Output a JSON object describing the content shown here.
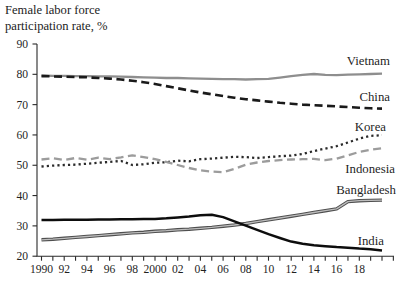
{
  "header": {
    "title_line1": "Female labor force",
    "title_line2": "participation rate, %"
  },
  "chart_data": {
    "type": "line",
    "title": "Female labor force participation rate, %",
    "xlabel": "",
    "ylabel": "Female labor force participation rate, %",
    "ylim": [
      20,
      90
    ],
    "yticks": [
      20,
      30,
      40,
      50,
      60,
      70,
      80,
      90
    ],
    "grid": false,
    "legend_position": "labels-at-line-ends",
    "axis_color": "#2a2a2a",
    "text_color": "#1f1f1f",
    "x_years": [
      1990,
      1991,
      1992,
      1993,
      1994,
      1995,
      1996,
      1997,
      1998,
      1999,
      2000,
      2001,
      2002,
      2003,
      2004,
      2005,
      2006,
      2007,
      2008,
      2009,
      2010,
      2011,
      2012,
      2013,
      2014,
      2015,
      2016,
      2017,
      2018,
      2019,
      2020
    ],
    "xticks_labeled": [
      [
        1990,
        "1990"
      ],
      [
        1992,
        "92"
      ],
      [
        1994,
        "94"
      ],
      [
        1996,
        "96"
      ],
      [
        1998,
        "98"
      ],
      [
        2000,
        "2000"
      ],
      [
        2002,
        "02"
      ],
      [
        2004,
        "04"
      ],
      [
        2006,
        "06"
      ],
      [
        2008,
        "08"
      ],
      [
        2010,
        "10"
      ],
      [
        2012,
        "12"
      ],
      [
        2014,
        "14"
      ],
      [
        2016,
        "16"
      ],
      [
        2018,
        "18"
      ]
    ],
    "series": [
      {
        "name": "Vietnam",
        "color": "#8e8e8e",
        "style": "solid",
        "width": 2.3,
        "label_x": 390,
        "label_y": 65,
        "values": [
          79.6,
          79.5,
          79.5,
          79.4,
          79.4,
          79.3,
          79.3,
          79.2,
          79.1,
          79.0,
          78.9,
          78.8,
          78.8,
          78.7,
          78.6,
          78.5,
          78.4,
          78.4,
          78.3,
          78.4,
          78.5,
          78.9,
          79.4,
          79.8,
          80.1,
          79.8,
          79.7,
          79.9,
          80.0,
          80.1,
          80.2
        ]
      },
      {
        "name": "China",
        "color": "#1a1a1a",
        "style": "dashed",
        "width": 2.6,
        "label_x": 390,
        "label_y": 101,
        "values": [
          79.4,
          79.3,
          79.2,
          79.1,
          79.0,
          78.8,
          78.6,
          78.3,
          77.9,
          77.4,
          76.8,
          76.1,
          75.4,
          74.7,
          74.0,
          73.4,
          72.8,
          72.3,
          71.8,
          71.4,
          71.0,
          70.6,
          70.3,
          70.0,
          69.8,
          69.6,
          69.4,
          69.2,
          69.0,
          68.8,
          68.7
        ]
      },
      {
        "name": "Korea",
        "color": "#2b2b2b",
        "style": "dotted",
        "width": 2.3,
        "label_x": 386,
        "label_y": 131,
        "values": [
          49.6,
          49.9,
          50.1,
          50.2,
          50.5,
          50.8,
          51.1,
          51.4,
          50.1,
          50.3,
          50.8,
          51.0,
          51.5,
          51.3,
          52.0,
          52.2,
          52.5,
          52.8,
          52.7,
          52.4,
          52.7,
          53.0,
          53.2,
          53.7,
          54.7,
          55.5,
          56.3,
          57.5,
          58.8,
          59.7,
          59.9
        ]
      },
      {
        "name": "Indonesia",
        "color": "#9c9c9c",
        "style": "dashed",
        "width": 2.3,
        "label_x": 395,
        "label_y": 173,
        "values": [
          51.9,
          52.3,
          51.7,
          52.4,
          51.8,
          52.5,
          52.0,
          52.6,
          53.3,
          52.7,
          52.0,
          51.1,
          50.1,
          49.1,
          48.3,
          47.9,
          47.7,
          48.8,
          50.2,
          50.9,
          51.4,
          51.7,
          51.9,
          52.0,
          52.1,
          51.7,
          52.2,
          53.3,
          54.4,
          55.1,
          55.6
        ]
      },
      {
        "name": "Bangladesh",
        "color": "#4f4f4f",
        "style": "double",
        "width": 3.4,
        "inner_color": "#bdbdbd",
        "label_x": 396,
        "label_y": 194,
        "values": [
          25.4,
          25.6,
          25.9,
          26.2,
          26.5,
          26.8,
          27.1,
          27.4,
          27.7,
          27.9,
          28.2,
          28.4,
          28.7,
          28.9,
          29.2,
          29.5,
          29.9,
          30.3,
          30.8,
          31.4,
          32.0,
          32.6,
          33.2,
          33.8,
          34.4,
          35.0,
          35.6,
          38.0,
          38.3,
          38.4,
          38.5
        ]
      },
      {
        "name": "India",
        "color": "#0d0d0d",
        "style": "solid",
        "width": 2.5,
        "label_x": 384,
        "label_y": 245,
        "values": [
          31.9,
          31.9,
          32.0,
          32.0,
          32.0,
          32.1,
          32.1,
          32.2,
          32.2,
          32.3,
          32.3,
          32.5,
          32.8,
          33.1,
          33.5,
          33.7,
          32.9,
          31.5,
          30.1,
          28.7,
          27.3,
          26.0,
          24.8,
          24.1,
          23.6,
          23.3,
          23.0,
          22.8,
          22.5,
          22.3,
          21.9
        ]
      }
    ]
  }
}
